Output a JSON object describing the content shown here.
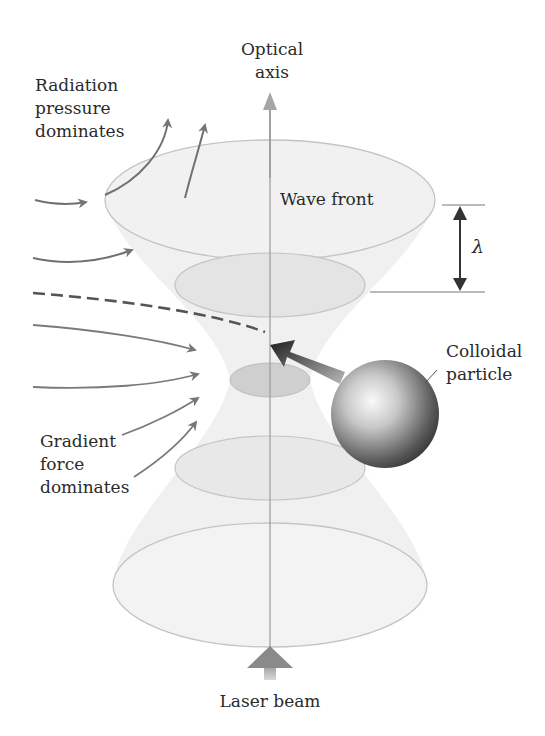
{
  "diagram": {
    "labels": {
      "optical_axis_line1": "Optical",
      "optical_axis_line2": "axis",
      "radiation_line1": "Radiation",
      "radiation_line2": "pressure",
      "radiation_line3": "dominates",
      "wave_front": "Wave front",
      "wavelength_symbol": "λ",
      "colloidal_line1": "Colloidal",
      "colloidal_line2": "particle",
      "gradient_line1": "Gradient",
      "gradient_line2": "force",
      "gradient_line3": "dominates",
      "laser_beam": "Laser beam"
    },
    "colors": {
      "beam_fill": "#ececec",
      "ellipse_stroke": "#bdbdbd",
      "arrow": "#777777",
      "dashed_path": "#555555",
      "particle_dark": "#3a3a3a",
      "particle_light": "#f5f5f5",
      "text": "#2a2a2a"
    },
    "nodes": [
      {
        "id": "optical-axis",
        "type": "arrow",
        "direction": "up"
      },
      {
        "id": "wave-front-top",
        "type": "ellipse",
        "cx": 270,
        "cy": 200,
        "rx": 165,
        "ry": 60
      },
      {
        "id": "wave-front-2",
        "type": "ellipse",
        "cx": 270,
        "cy": 285,
        "rx": 95,
        "ry": 32
      },
      {
        "id": "focus",
        "type": "ellipse",
        "cx": 270,
        "cy": 380,
        "rx": 40,
        "ry": 17
      },
      {
        "id": "wave-front-4",
        "type": "ellipse",
        "cx": 270,
        "cy": 468,
        "rx": 95,
        "ry": 32
      },
      {
        "id": "wave-front-bottom",
        "type": "ellipse",
        "cx": 270,
        "cy": 585,
        "rx": 157,
        "ry": 62
      },
      {
        "id": "colloidal-particle",
        "type": "sphere",
        "cx": 385,
        "cy": 414,
        "r": 54
      },
      {
        "id": "laser-beam-arrow",
        "type": "arrow",
        "direction": "up"
      }
    ],
    "edges": [
      {
        "from": "colloidal-particle",
        "to": "focus",
        "style": "bold-gradient-arrow"
      },
      {
        "from": "left",
        "to": "focus",
        "style": "dashed",
        "meaning": "particle trajectory"
      }
    ]
  }
}
